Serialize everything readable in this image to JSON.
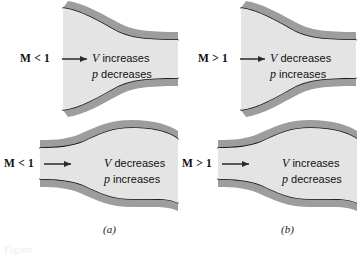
{
  "figure": {
    "type": "textbook-diagram",
    "background_color": "#ffffff",
    "wall_fill_color": "#9d9d9d",
    "wall_line_color": "#1a1a1a",
    "interior_fill_color": "#e4e4e4",
    "arrow_color": "#2a2a2a"
  },
  "panels": [
    {
      "id": "top-left",
      "shape": "converging-duct",
      "mach_label": "M < 1",
      "mach_symbol": "M",
      "mach_relation": "<",
      "mach_value": "1",
      "line1": "V increases",
      "line1_symbol": "V",
      "line1_text": "increases",
      "line2": "p decreases",
      "line2_symbol": "p",
      "line2_text": "decreases"
    },
    {
      "id": "top-right",
      "shape": "converging-duct",
      "mach_label": "M > 1",
      "mach_symbol": "M",
      "mach_relation": ">",
      "mach_value": "1",
      "line1": "V decreases",
      "line1_symbol": "V",
      "line1_text": "decreases",
      "line2": "p increases",
      "line2_symbol": "p",
      "line2_text": "increases"
    },
    {
      "id": "bottom-left",
      "shape": "diverging-duct",
      "mach_label": "M < 1",
      "mach_symbol": "M",
      "mach_relation": "<",
      "mach_value": "1",
      "line1": "V decreases",
      "line1_symbol": "V",
      "line1_text": "decreases",
      "line2": "p increases",
      "line2_symbol": "p",
      "line2_text": "increases"
    },
    {
      "id": "bottom-right",
      "shape": "diverging-duct",
      "mach_label": "M > 1",
      "mach_symbol": "M",
      "mach_relation": ">",
      "mach_value": "1",
      "line1": "V increases",
      "line1_symbol": "V",
      "line1_text": "increases",
      "line2": "p decreases",
      "line2_symbol": "p",
      "line2_text": "decreases"
    }
  ],
  "column_labels": {
    "left": "(a)",
    "right": "(b)"
  },
  "caption_stub": "Figure"
}
